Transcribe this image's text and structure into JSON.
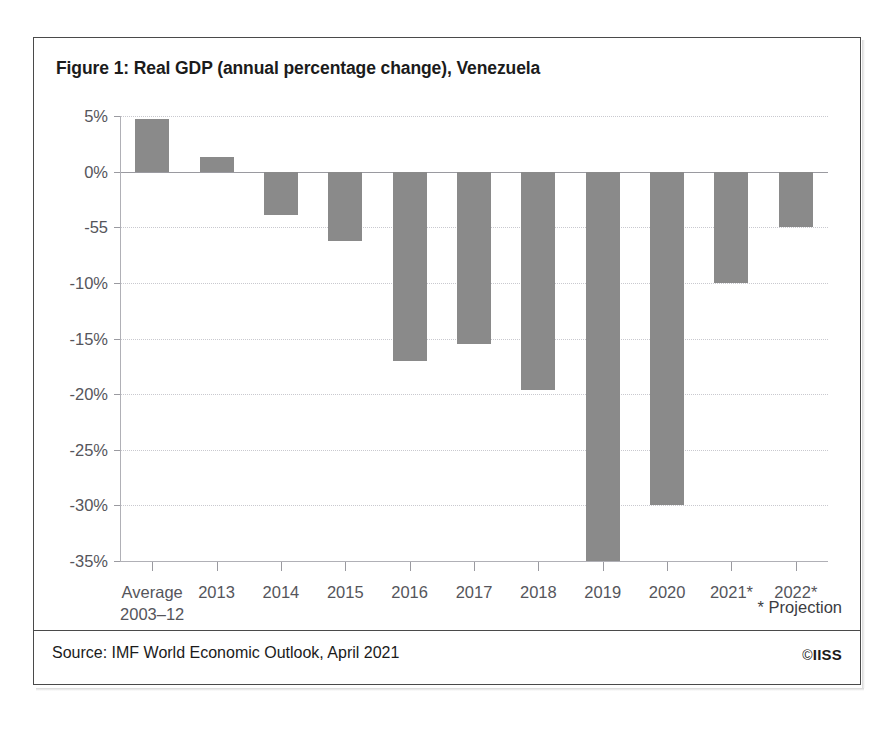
{
  "figure": {
    "title": "Figure 1: Real GDP (annual percentage change), Venezuela",
    "source": "Source: IMF World Economic Outlook, April 2021",
    "projection_note": "* Projection",
    "copyright_glyph": "©",
    "copyright_owner": "IISS",
    "frame_color": "#4a4a4a",
    "bar_color": "#8a8a8a",
    "gridline_color": "#c9c9cf",
    "axis_color": "#b0b0b6",
    "text_color": "#1b1b1b",
    "tick_text_color": "#55555b"
  },
  "chart_data": {
    "type": "bar",
    "title": "Figure 1: Real GDP (annual percentage change), Venezuela",
    "xlabel": "",
    "ylabel": "",
    "ylim": [
      -35,
      5
    ],
    "grid": true,
    "legend": "none",
    "orientation": "vertical",
    "units": "percent",
    "categories": [
      "Average\n2003–12",
      "2013",
      "2014",
      "2015",
      "2016",
      "2017",
      "2018",
      "2019",
      "2020",
      "2021*",
      "2022*"
    ],
    "values": [
      4.7,
      1.3,
      -3.9,
      -6.2,
      -17.0,
      -15.5,
      -19.6,
      -35.0,
      -30.0,
      -10.0,
      -5.0
    ],
    "yticks": [
      5,
      0,
      -5,
      -10,
      -15,
      -20,
      -25,
      -30,
      -35
    ],
    "ytick_labels": [
      "5%",
      "0%",
      "-55",
      "-10%",
      "-15%",
      "-20%",
      "-25%",
      "-30%",
      "-35%"
    ],
    "annotations": [
      "* Projection"
    ]
  }
}
